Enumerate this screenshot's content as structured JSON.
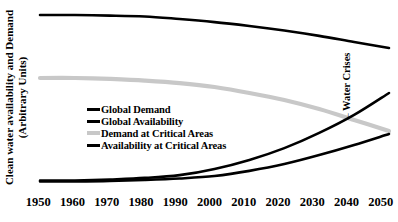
{
  "figure": {
    "background": "#ffffff",
    "y_axis_label": {
      "line1": "Clean water availability and Demand",
      "line2": "(Arbitrary Units)"
    }
  },
  "chart_data": {
    "type": "line",
    "title": "",
    "xlabel": "",
    "ylabel": "Clean water availability and Demand (Arbitrary Units)",
    "x": [
      1950,
      1960,
      1970,
      1980,
      1990,
      2000,
      2010,
      2020,
      2030,
      2040,
      2050
    ],
    "xlim": [
      1950,
      2050
    ],
    "ylim": [
      0,
      100
    ],
    "y_units": "arbitrary units (no tick marks shown)",
    "grid": false,
    "axes_box": false,
    "legend_position": "inside-center-left",
    "legend": [
      {
        "label": "Global Demand",
        "color": "#000000",
        "swatch_thickness_px": 3
      },
      {
        "label": "Global Availability",
        "color": "#000000",
        "swatch_thickness_px": 3
      },
      {
        "label": "Demand at Critical Areas",
        "color": "#c8c8c8",
        "swatch_thickness_px": 4
      },
      {
        "label": "Availability at Critical Areas",
        "color": "#000000",
        "swatch_thickness_px": 3
      }
    ],
    "series": [
      {
        "id": "availability-critical-areas",
        "name": "Availability at Critical Areas",
        "color": "#c8c8c8",
        "stroke_width": 4.2,
        "values": [
          62.2,
          62.2,
          61.7,
          60.8,
          59.4,
          57.2,
          53.9,
          50.0,
          45.0,
          38.9,
          32.8
        ]
      },
      {
        "id": "global-availability",
        "name": "Global Availability",
        "color": "#000000",
        "stroke_width": 2.6,
        "values": [
          97.2,
          97.2,
          96.9,
          96.4,
          95.0,
          93.3,
          91.1,
          88.6,
          85.6,
          82.2,
          78.9
        ]
      },
      {
        "id": "demand-critical-areas",
        "name": "Demand at Critical Areas",
        "color": "#000000",
        "stroke_width": 2.6,
        "values": [
          5.3,
          5.3,
          5.8,
          6.7,
          8.3,
          11.7,
          16.7,
          23.3,
          31.7,
          41.7,
          53.9
        ]
      },
      {
        "id": "global-demand",
        "name": "Global Demand",
        "color": "#000000",
        "stroke_width": 2.6,
        "values": [
          4.7,
          4.7,
          5.0,
          5.6,
          6.4,
          7.8,
          10.6,
          14.4,
          19.4,
          25.0,
          31.1
        ]
      }
    ],
    "annotation": {
      "label": "←Water Crises",
      "points_at": {
        "x": 2037,
        "y": 40
      }
    }
  }
}
